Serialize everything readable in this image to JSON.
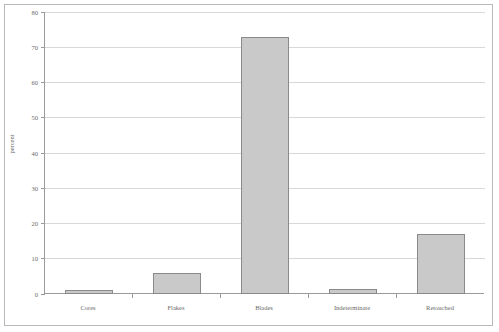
{
  "chart_data": {
    "type": "bar",
    "title": "",
    "xlabel": "",
    "ylabel": "percent",
    "categories": [
      "Cores",
      "Flakes",
      "Blades",
      "Indeterminate",
      "Retouched"
    ],
    "values": [
      1,
      6,
      73,
      1.5,
      17
    ],
    "ylim": [
      0,
      80
    ],
    "yticks": [
      0,
      10,
      20,
      30,
      40,
      50,
      60,
      70,
      80
    ],
    "ytick_labels": [
      "0",
      "10",
      "20",
      "30",
      "40",
      "50",
      "60",
      "70",
      "80"
    ],
    "grid": true,
    "legend": null,
    "bar_fill_color": "#c9c9c9",
    "bar_edge_color": "#8a8a8a",
    "grid_color": "#d8d8d8",
    "axis_color": "#9a9a9a",
    "frame_color": "#b9b9b9",
    "background_color": "#ffffff"
  }
}
